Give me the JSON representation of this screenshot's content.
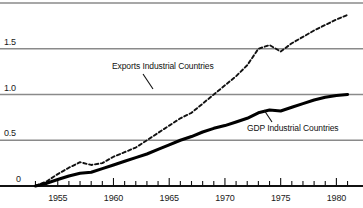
{
  "chart_data": {
    "type": "line",
    "title": "",
    "subtitle": "",
    "xlabel": "",
    "ylabel": "",
    "xlim": [
      1952.6,
      1981.4
    ],
    "ylim": [
      0,
      2.05
    ],
    "grid": true,
    "grid_axis": "y",
    "legend_position": "inline-annotations",
    "y_ticks": [
      0,
      0.5,
      1.0,
      1.5,
      2.0
    ],
    "y_tick_labels": [
      "0",
      "0.5",
      "1.0",
      "1.5",
      "2.0"
    ],
    "x_ticks": [
      1953,
      1954,
      1955,
      1956,
      1957,
      1958,
      1959,
      1960,
      1961,
      1962,
      1963,
      1964,
      1965,
      1966,
      1967,
      1968,
      1969,
      1970,
      1971,
      1972,
      1973,
      1974,
      1975,
      1976,
      1977,
      1978,
      1979,
      1980,
      1981
    ],
    "x_major_ticks": [
      1955,
      1960,
      1965,
      1970,
      1975,
      1980
    ],
    "x_tick_labels": [
      "1955",
      "1960",
      "1965",
      "1970",
      "1975",
      "1980"
    ],
    "x": [
      1953,
      1954,
      1955,
      1956,
      1957,
      1958,
      1959,
      1960,
      1961,
      1962,
      1963,
      1964,
      1965,
      1966,
      1967,
      1968,
      1969,
      1970,
      1971,
      1972,
      1973,
      1974,
      1975,
      1976,
      1977,
      1978,
      1979,
      1980,
      1981
    ],
    "series": [
      {
        "name": "Exports Industrial Countries",
        "style": "dashed",
        "color": "#111111",
        "values": [
          0.0,
          0.05,
          0.13,
          0.2,
          0.26,
          0.23,
          0.25,
          0.32,
          0.37,
          0.42,
          0.5,
          0.58,
          0.66,
          0.74,
          0.8,
          0.9,
          1.0,
          1.1,
          1.2,
          1.32,
          1.5,
          1.54,
          1.47,
          1.56,
          1.63,
          1.7,
          1.76,
          1.82,
          1.87
        ]
      },
      {
        "name": "GDP Industrial Countries",
        "style": "solid",
        "color": "#000000",
        "values": [
          0.0,
          0.03,
          0.07,
          0.11,
          0.14,
          0.15,
          0.19,
          0.23,
          0.27,
          0.31,
          0.35,
          0.4,
          0.45,
          0.5,
          0.54,
          0.59,
          0.63,
          0.66,
          0.7,
          0.74,
          0.8,
          0.83,
          0.82,
          0.86,
          0.9,
          0.94,
          0.97,
          0.99,
          1.0
        ]
      }
    ],
    "annotations": [
      {
        "text": "Exports Industrial Countries",
        "label_x": 112,
        "label_y": 62,
        "leader_from_x": 143,
        "leader_from_y": 74,
        "leader_to_x": 153,
        "leader_to_y": 89
      },
      {
        "text": "GDP Industrial Countries",
        "label_x": 247,
        "label_y": 124,
        "leader_from_x": 272,
        "leader_from_y": 122,
        "leader_to_x": 264,
        "leader_to_y": 110
      }
    ]
  },
  "axis_colors": {
    "gridline": "#8a8a8a",
    "baseline": "#111111",
    "tick": "#111111",
    "text": "#1a1a1a"
  }
}
